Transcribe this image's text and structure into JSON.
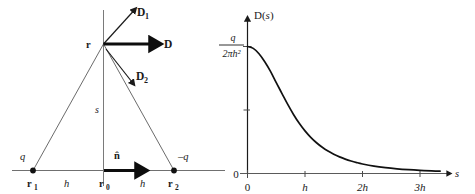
{
  "figure": {
    "panels": [
      "dipole-geometry",
      "dipole-field-plot"
    ]
  },
  "diagram": {
    "name": "dipole-geometry",
    "vectors": [
      {
        "id": "D1",
        "label": "D",
        "sub": "1",
        "direction": "up-right",
        "style": "thin"
      },
      {
        "id": "D",
        "label": "D",
        "sub": "",
        "direction": "right",
        "style": "thick"
      },
      {
        "id": "D2",
        "label": "D",
        "sub": "2",
        "direction": "down-right",
        "style": "thin"
      },
      {
        "id": "nhat",
        "label": "n̂",
        "sub": "",
        "direction": "right",
        "style": "thick"
      }
    ],
    "points": [
      {
        "id": "r",
        "label": "r",
        "role": "field-point"
      },
      {
        "id": "r1",
        "label": "r",
        "sub": "1",
        "role": "positive-charge-position"
      },
      {
        "id": "r0",
        "label": "r",
        "sub": "0",
        "role": "midpoint"
      },
      {
        "id": "r2",
        "label": "r",
        "sub": "2",
        "role": "negative-charge-position"
      }
    ],
    "charges": [
      {
        "id": "q-positive",
        "label": "q"
      },
      {
        "id": "q-negative",
        "label": "–q"
      }
    ],
    "distances": [
      {
        "id": "h-left",
        "label": "h"
      },
      {
        "id": "h-right",
        "label": "h"
      },
      {
        "id": "s-vertical",
        "label": "s"
      }
    ]
  },
  "chart_data": {
    "type": "line",
    "title": "",
    "xlabel": "s",
    "ylabel": "D(s)",
    "x_tick_labels": [
      "0",
      "h",
      "2h",
      "3h"
    ],
    "x_tick_values": [
      0,
      1,
      2,
      3
    ],
    "y_tick_labels": [
      "0",
      "",
      "q⁄2πh²"
    ],
    "y_axis_top_label_numerator": "q",
    "y_axis_top_label_denominator": "2πh²",
    "y_axis_zero_label": "0",
    "xlim": [
      0,
      3.4
    ],
    "ylim": [
      0,
      1.08
    ],
    "grid": false,
    "legend": null,
    "x": [
      0,
      0.1,
      0.2,
      0.3,
      0.4,
      0.5,
      0.6,
      0.7,
      0.8,
      0.9,
      1.0,
      1.1,
      1.2,
      1.3,
      1.4,
      1.5,
      1.6,
      1.7,
      1.8,
      1.9,
      2.0,
      2.2,
      2.4,
      2.6,
      2.8,
      3.0,
      3.2,
      3.35
    ],
    "values": [
      1.0,
      0.9852,
      0.9433,
      0.8805,
      0.8044,
      0.7155,
      0.6295,
      0.544,
      0.465,
      0.3953,
      0.3354,
      0.2847,
      0.2421,
      0.2065,
      0.1767,
      0.1518,
      0.1309,
      0.1133,
      0.0984,
      0.0858,
      0.0751,
      0.0584,
      0.0461,
      0.0369,
      0.0299,
      0.0245,
      0.0203,
      0.018
    ],
    "curve_formula": "D(s) = (q/2πh²) · (1 + (s/h)²)^(-3/2)"
  }
}
